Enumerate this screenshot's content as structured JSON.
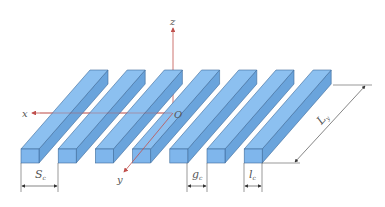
{
  "figure": {
    "bar_count": 7,
    "colors": {
      "bar_fill": "#7fb6ec",
      "bar_top": "#8cc0f0",
      "bar_side": "#6aa4dc",
      "bar_stroke": "#3d6a9a",
      "axis": "#c0504d",
      "dimension": "#333333"
    },
    "axes": {
      "x_label": "x",
      "y_label": "y",
      "z_label": "z",
      "origin_label": "O"
    },
    "dimensions": {
      "period_label": "S",
      "period_subscript": "c",
      "gap_label": "g",
      "gap_subscript": "c",
      "width_label": "l",
      "width_subscript": "c",
      "length_label": "L",
      "length_subscript": "y"
    }
  }
}
